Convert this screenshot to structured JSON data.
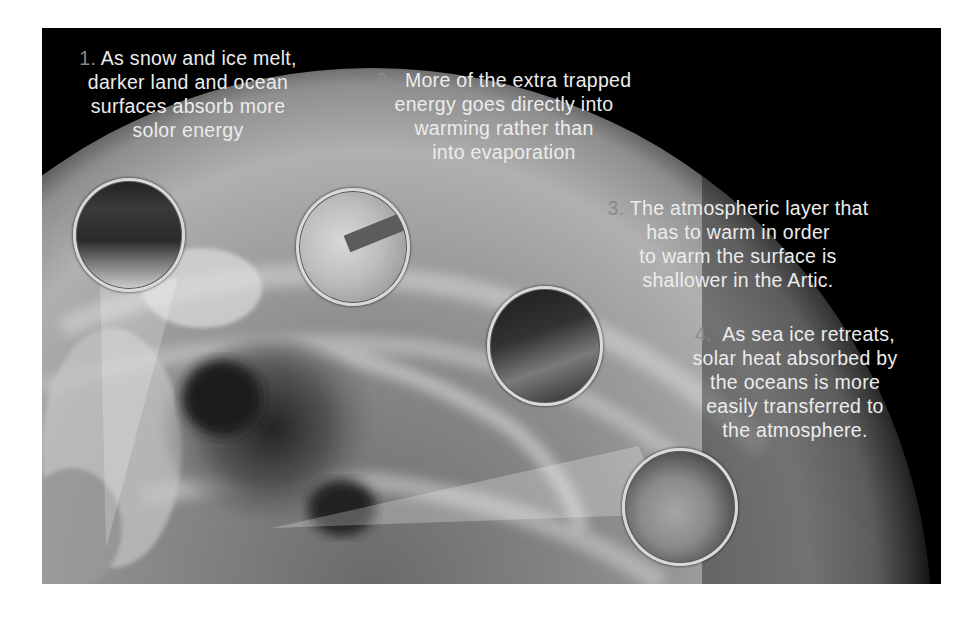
{
  "figure": {
    "background_color": "#000000",
    "page_background": "#ffffff",
    "number_color": "#8a8a8a",
    "text_color": "#ececec",
    "image_subject": "grayscale satellite view of Arctic Earth curvature with cloud swirl",
    "captions": [
      {
        "number": "1.",
        "lines": [
          "As snow and ice melt,",
          "darker land and ocean",
          "surfaces absorb more",
          "solor energy"
        ]
      },
      {
        "number": "2.",
        "lines": [
          "More of the extra trapped",
          "energy goes directly into",
          "warming rather than",
          "into evaporation"
        ]
      },
      {
        "number": "3.",
        "lines": [
          "The atmospheric layer that",
          "has to warm in order",
          "to warm the surface is",
          "shallower in the Artic."
        ]
      },
      {
        "number": "4.",
        "lines": [
          "As sea ice retreats,",
          "solar heat absorbed by",
          "the oceans is more",
          "easily transferred to",
          "the atmosphere."
        ]
      }
    ],
    "insets": [
      {
        "label": "land-ocean-surface-inset"
      },
      {
        "label": "energy-arrow-inset"
      },
      {
        "label": "atmospheric-layer-inset"
      },
      {
        "label": "sea-ice-inset"
      }
    ]
  }
}
